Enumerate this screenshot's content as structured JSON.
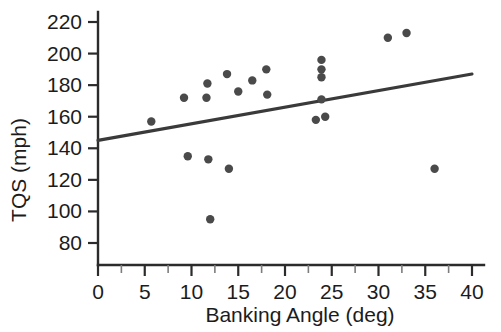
{
  "chart_data": {
    "type": "scatter",
    "title": "",
    "xlabel": "Banking Angle (deg)",
    "ylabel": "TQS (mph)",
    "xlim": [
      0,
      40
    ],
    "ylim": [
      70,
      228
    ],
    "grid": false,
    "legend": null,
    "x_ticks": [
      0,
      5,
      10,
      15,
      20,
      25,
      30,
      35,
      40
    ],
    "x_tick_labels": [
      "0",
      "5",
      "10",
      "15",
      "20",
      "25",
      "30",
      "35",
      "40"
    ],
    "x_minor_ticks": [
      2.5,
      7.5,
      12.5,
      17.5,
      22.5,
      27.5,
      32.5,
      37.5
    ],
    "y_ticks": [
      80,
      100,
      120,
      140,
      160,
      180,
      200,
      220
    ],
    "y_tick_labels": [
      "80",
      "100",
      "120",
      "140",
      "160",
      "180",
      "200",
      "220"
    ],
    "marker": "filled-circle",
    "marker_color": "#4a4a4a",
    "line_color": "#3a3a3a",
    "points": [
      {
        "x": 5.7,
        "y": 157
      },
      {
        "x": 9.2,
        "y": 172
      },
      {
        "x": 9.6,
        "y": 135
      },
      {
        "x": 11.6,
        "y": 172
      },
      {
        "x": 11.7,
        "y": 181
      },
      {
        "x": 11.8,
        "y": 133
      },
      {
        "x": 12.0,
        "y": 95
      },
      {
        "x": 13.8,
        "y": 187
      },
      {
        "x": 14.0,
        "y": 127
      },
      {
        "x": 15.0,
        "y": 176
      },
      {
        "x": 16.5,
        "y": 183
      },
      {
        "x": 18.0,
        "y": 190
      },
      {
        "x": 18.1,
        "y": 174
      },
      {
        "x": 23.9,
        "y": 196
      },
      {
        "x": 23.9,
        "y": 190
      },
      {
        "x": 23.9,
        "y": 185
      },
      {
        "x": 23.9,
        "y": 171
      },
      {
        "x": 23.3,
        "y": 158
      },
      {
        "x": 24.3,
        "y": 160
      },
      {
        "x": 31.0,
        "y": 210
      },
      {
        "x": 33.0,
        "y": 213
      },
      {
        "x": 36.0,
        "y": 127
      }
    ],
    "fit_line": {
      "x_start": 0,
      "y_start": 145,
      "x_end": 40,
      "y_end": 187
    }
  }
}
